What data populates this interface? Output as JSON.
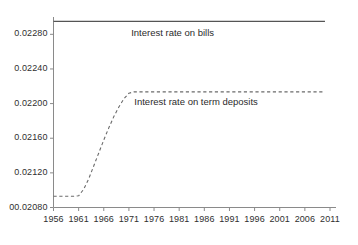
{
  "chart_data": {
    "type": "line",
    "title": "",
    "subtitle": "",
    "xlabel": "",
    "ylabel": "",
    "xlim": [
      1956,
      2011
    ],
    "ylim": [
      0.0208,
      0.023
    ],
    "grid": false,
    "legend_position": "inline-annotation",
    "x_ticks": [
      "1956",
      "1961",
      "1966",
      "1971",
      "1976",
      "1981",
      "1986",
      "1991",
      "1996",
      "2001",
      "2006",
      "2011"
    ],
    "x_tick_values": [
      1956,
      1961,
      1966,
      1971,
      1976,
      1981,
      1986,
      1991,
      1996,
      2001,
      2006,
      2011
    ],
    "y_ticks": [
      "00.02080",
      "0.02120",
      "0.02160",
      "0.02200",
      "0.02240",
      "0.02280"
    ],
    "y_tick_values": [
      0.0208,
      0.0212,
      0.0216,
      0.022,
      0.0224,
      0.0228
    ],
    "series": [
      {
        "name": "Interest rate on bills",
        "style": "solid",
        "color": "#555555",
        "x": [
          1956,
          1961,
          1966,
          1971,
          1976,
          1981,
          1986,
          1991,
          1996,
          2001,
          2006,
          2010
        ],
        "values": [
          0.02295,
          0.02295,
          0.02295,
          0.02295,
          0.02295,
          0.02295,
          0.02295,
          0.02295,
          0.02295,
          0.02295,
          0.02295,
          0.02295
        ],
        "annotation": "Interest rate on bills",
        "annotation_x": 1981,
        "annotation_y": 0.02282
      },
      {
        "name": "Interest rate on term deposits",
        "style": "dashed",
        "color": "#6b6b6b",
        "x": [
          1956,
          1957,
          1958,
          1959,
          1960,
          1961,
          1962,
          1963,
          1964,
          1965,
          1966,
          1967,
          1968,
          1969,
          1970,
          1971,
          1972,
          1973,
          1976,
          1981,
          1986,
          1991,
          1996,
          2001,
          2006,
          2010
        ],
        "values": [
          0.02093,
          0.02093,
          0.02093,
          0.02093,
          0.02093,
          0.020935,
          0.02101,
          0.02113,
          0.02128,
          0.02143,
          0.02158,
          0.02172,
          0.02185,
          0.02196,
          0.022055,
          0.02212,
          0.022135,
          0.022135,
          0.022135,
          0.022135,
          0.022135,
          0.022135,
          0.022135,
          0.022135,
          0.022135,
          0.022135
        ],
        "annotation": "Interest rate on term deposits",
        "annotation_x": 1986,
        "annotation_y": 0.02202
      }
    ]
  }
}
